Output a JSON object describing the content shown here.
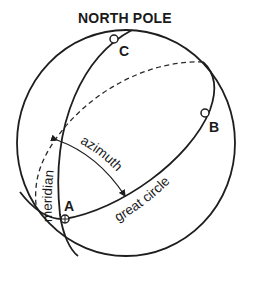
{
  "diagram": {
    "title": "NORTH POLE",
    "points": {
      "a": "A",
      "b": "B",
      "c": "C"
    },
    "labels": {
      "meridian": "meridian",
      "azimuth": "azimuth",
      "great_circle": "great circle"
    },
    "colors": {
      "ink": "#1e1e1e",
      "background": "#ffffff"
    }
  }
}
